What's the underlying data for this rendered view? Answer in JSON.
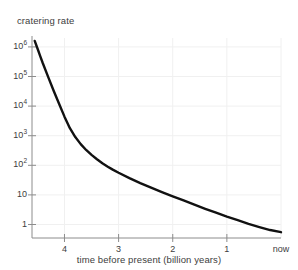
{
  "figure": {
    "background_color": "#ffffff",
    "curve_color": "#111111",
    "axis_color": "#8c8c8c",
    "grid_color": "#f0f0f0",
    "text_color": "#3d3d3d"
  },
  "chart_data": {
    "type": "line",
    "title": "cratering rate",
    "xlabel": "time before present (billion years)",
    "ylabel": "cratering rate",
    "yscale": "log",
    "xscale": "linear",
    "grid": true,
    "legend": null,
    "x_axis_reversed": true,
    "xlim": [
      4.6,
      0
    ],
    "ylim": [
      0.35,
      2000000
    ],
    "x_tick_values": [
      4,
      3,
      2,
      1,
      0
    ],
    "x_tick_labels": [
      "4",
      "3",
      "2",
      "1",
      "now"
    ],
    "y_tick_values": [
      1,
      10,
      100,
      1000,
      10000,
      100000,
      1000000
    ],
    "y_tick_labels": [
      "1",
      "10",
      "10^2",
      "10^3",
      "10^4",
      "10^5",
      "10^6"
    ],
    "y_tick_labels_display": [
      "1",
      "10",
      "10²",
      "10³",
      "10⁴",
      "10⁵",
      "10⁶"
    ],
    "series": [
      {
        "name": "cratering rate",
        "x": [
          4.55,
          4.5,
          4.45,
          4.4,
          4.3,
          4.2,
          4.1,
          4.0,
          3.9,
          3.8,
          3.7,
          3.6,
          3.5,
          3.4,
          3.3,
          3.2,
          3.1,
          3.0,
          2.8,
          2.6,
          2.4,
          2.2,
          2.0,
          1.8,
          1.6,
          1.4,
          1.2,
          1.0,
          0.8,
          0.6,
          0.4,
          0.2,
          0.0
        ],
        "y": [
          1600000,
          900000,
          500000,
          280000,
          95000,
          33000,
          12000,
          4400,
          1800,
          900,
          520,
          330,
          225,
          160,
          118,
          90,
          70,
          56,
          37,
          25,
          17.5,
          12.5,
          9.0,
          6.5,
          4.7,
          3.4,
          2.5,
          1.85,
          1.4,
          1.05,
          0.82,
          0.65,
          0.55
        ]
      }
    ],
    "annotations": []
  }
}
